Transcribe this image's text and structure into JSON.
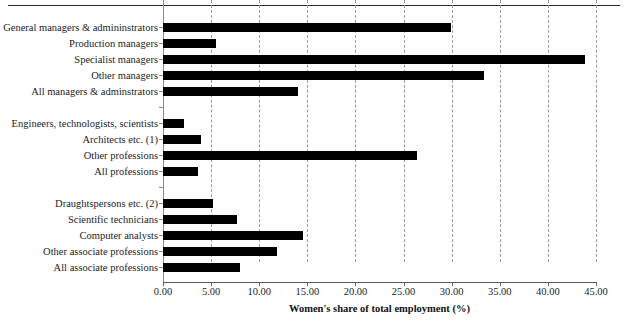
{
  "header": {
    "cropped_text": ""
  },
  "chart_data": {
    "type": "bar",
    "orientation": "horizontal",
    "title": "",
    "xlabel": "Women's share of total employment (%)",
    "ylabel": "",
    "xlim": [
      0.0,
      45.0
    ],
    "xtick_step": 5.0,
    "xticks": [
      "0.00",
      "5.00",
      "10.00",
      "15.00",
      "20.00",
      "25.00",
      "30.00",
      "35.00",
      "40.00",
      "45.00"
    ],
    "xtick_values": [
      0,
      5,
      10,
      15,
      20,
      25,
      30,
      35,
      40,
      45
    ],
    "grid": true,
    "grid_axis": "x",
    "grid_style": "dashed",
    "legend": false,
    "bar_color": "#000000",
    "groups": [
      {
        "name": "Managers & administrators",
        "categories": [
          "General managers & admininstrators",
          "Production managers",
          "Specialist managers",
          "Other managers",
          "All managers & adminstrators"
        ],
        "values": [
          29.9,
          5.5,
          43.9,
          33.4,
          14.0
        ]
      },
      {
        "name": "Professions",
        "categories": [
          "Engineers, technologists, scientists",
          "Architects etc. (1)",
          "Other professions",
          "All professions"
        ],
        "values": [
          2.2,
          3.9,
          26.4,
          3.6
        ]
      },
      {
        "name": "Associate professions",
        "categories": [
          "Draughtspersons etc. (2)",
          "Scientific technicians",
          "Computer analysts",
          "Other associate professions",
          "All associate professions"
        ],
        "values": [
          5.2,
          7.7,
          14.5,
          11.8,
          8.0
        ]
      }
    ],
    "categories": [
      "General managers & admininstrators",
      "Production managers",
      "Specialist managers",
      "Other managers",
      "All managers & adminstrators",
      "Engineers, technologists, scientists",
      "Architects etc. (1)",
      "Other professions",
      "All professions",
      "Draughtspersons etc. (2)",
      "Scientific technicians",
      "Computer analysts",
      "Other associate professions",
      "All associate professions"
    ],
    "values": [
      29.9,
      5.5,
      43.9,
      33.4,
      14.0,
      2.2,
      3.9,
      26.4,
      3.6,
      5.2,
      7.7,
      14.5,
      11.8,
      8.0
    ]
  }
}
